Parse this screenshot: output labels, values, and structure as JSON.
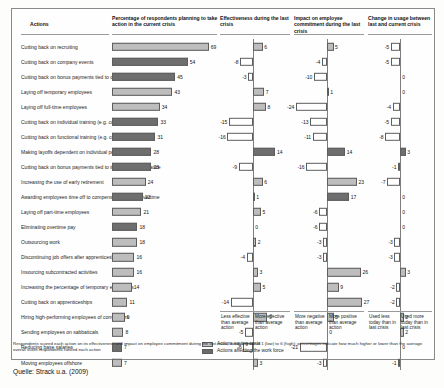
{
  "columns": {
    "actions": "Actions",
    "percentage": "Percentage of respondents planning to take action in the current crisis",
    "effectiveness": "Effectiveness during the last crisis",
    "impact": "Impact on employee commitment during the last crisis",
    "change": "Change in usage between last and current crisis"
  },
  "axis_captions": {
    "eff_neg": "Less effective than average action",
    "eff_pos": "More effective than average action",
    "imp_neg": "More negative than average action",
    "imp_pos": "More positive than average action",
    "chg_neg": "Used less today than in last crisis",
    "chg_pos": "Used more today than in last crisis"
  },
  "legend": [
    {
      "key": "cost",
      "label": "Actions saving costs"
    },
    {
      "key": "work",
      "label": "Actions affecting the work force"
    }
  ],
  "footnote": "Respondents scored each action on its effectiveness and impact on employee commitment during the last crisis, using a scale of 1 (low) to 6 (high); percentages indicate how much higher or lower than the average overall score respondents ranked each action",
  "source": "Quelle: Strack u.a. (2009)",
  "chart_data": {
    "type": "bar",
    "xlabel": "",
    "ylabel": "Actions",
    "grid": false,
    "legend_position": "bottom-right",
    "series": [
      {
        "name": "Percentage of respondents planning to take action in the current crisis",
        "axis_min": 0,
        "axis_max": 72
      },
      {
        "name": "Effectiveness during the last crisis",
        "axis_min": -20,
        "axis_max": 20
      },
      {
        "name": "Impact on employee commitment during the last crisis",
        "axis_min": -20,
        "axis_max": 26
      },
      {
        "name": "Change in usage between last and current crisis",
        "axis_min": -9,
        "axis_max": 5
      }
    ],
    "categories": [
      "Cutting back on recruiting",
      "Cutting back on company events",
      "Cutting back on bonus payments tied to company performance",
      "Laying off temporary employees",
      "Laying off full-time employees",
      "Cutting back on individual training (e.g. coaching)",
      "Cutting back on functional training (e.g. computer skills)",
      "Making layoffs dependent on individual performance",
      "Cutting back on bonus payments tied to individual performance",
      "Increasing the use of early retirement",
      "Awarding employees time off to compensate for extra overtime",
      "Laying off part-time employees",
      "Eliminating overtime pay",
      "Outsourcing work",
      "Discontinuing job offers after apprenticeships",
      "Insourcing subcontracted activities",
      "Increasing the percentage of temporary employees",
      "Cutting back on apprenticeships",
      "Hiring high-performing employees of competitors",
      "Sending employees on sabbaticals",
      "Reducing base salaries",
      "Moving employees offshore"
    ],
    "rows": [
      {
        "action": "Cutting back on recruiting",
        "type": "cost",
        "percentage": 69,
        "effectiveness": 6,
        "impact": 5,
        "change": -5
      },
      {
        "action": "Cutting back on company events",
        "type": "work",
        "percentage": 54,
        "effectiveness": -8,
        "impact": -4,
        "change": -5
      },
      {
        "action": "Cutting back on bonus payments tied to company performance",
        "type": "work",
        "percentage": 45,
        "effectiveness": -3,
        "impact": -10,
        "change": 0
      },
      {
        "action": "Laying off temporary employees",
        "type": "cost",
        "percentage": 43,
        "effectiveness": 7,
        "impact": 1,
        "change": 0
      },
      {
        "action": "Laying off full-time employees",
        "type": "cost",
        "percentage": 34,
        "effectiveness": 8,
        "impact": -24,
        "change": -4
      },
      {
        "action": "Cutting back on individual training (e.g. coaching)",
        "type": "work",
        "percentage": 33,
        "effectiveness": -15,
        "impact": -13,
        "change": -5
      },
      {
        "action": "Cutting back on functional training (e.g. computer skills)",
        "type": "work",
        "percentage": 31,
        "effectiveness": -16,
        "impact": -11,
        "change": -8
      },
      {
        "action": "Making layoffs dependent on individual performance",
        "type": "work",
        "percentage": 28,
        "effectiveness": 14,
        "impact": 14,
        "change": 3
      },
      {
        "action": "Cutting back on bonus payments tied to individual performance",
        "type": "work",
        "percentage": 28,
        "effectiveness": -9,
        "impact": -16,
        "change": -1
      },
      {
        "action": "Increasing the use of early retirement",
        "type": "cost",
        "percentage": 24,
        "effectiveness": 6,
        "impact": 23,
        "change": -7
      },
      {
        "action": "Awarding employees time off to compensate for extra overtime",
        "type": "work",
        "percentage": 22,
        "effectiveness": 1,
        "impact": 17,
        "change": 0
      },
      {
        "action": "Laying off part-time employees",
        "type": "cost",
        "percentage": 21,
        "effectiveness": 5,
        "impact": -6,
        "change": 0
      },
      {
        "action": "Eliminating overtime pay",
        "type": "work",
        "percentage": 18,
        "effectiveness": 0,
        "impact": -6,
        "change": 0
      },
      {
        "action": "Outsourcing work",
        "type": "cost",
        "percentage": 18,
        "effectiveness": 2,
        "impact": -3,
        "change": -3
      },
      {
        "action": "Discontinuing job offers after apprenticeships",
        "type": "cost",
        "percentage": 16,
        "effectiveness": -4,
        "impact": -3,
        "change": -3
      },
      {
        "action": "Insourcing subcontracted activities",
        "type": "cost",
        "percentage": 16,
        "effectiveness": 3,
        "impact": 26,
        "change": 3
      },
      {
        "action": "Increasing the percentage of temporary employees",
        "type": "cost",
        "percentage": 14,
        "effectiveness": 5,
        "impact": 9,
        "change": -2
      },
      {
        "action": "Cutting back on apprenticeships",
        "type": "cost",
        "percentage": 11,
        "effectiveness": -14,
        "impact": 27,
        "change": -2
      },
      {
        "action": "Hiring high-performing employees of competitors",
        "type": "cost",
        "percentage": 9,
        "effectiveness": 9,
        "impact": 5,
        "change": 2
      },
      {
        "action": "Sending employees on sabbaticals",
        "type": "cost",
        "percentage": 8,
        "effectiveness": -5,
        "impact": 0,
        "change": 2
      },
      {
        "action": "Reducing base salaries",
        "type": "work",
        "percentage": 7,
        "effectiveness": -6,
        "impact": -21,
        "change": 0
      },
      {
        "action": "Moving employees offshore",
        "type": "cost",
        "percentage": 7,
        "effectiveness": 3,
        "impact": -3,
        "change": -1
      }
    ]
  }
}
